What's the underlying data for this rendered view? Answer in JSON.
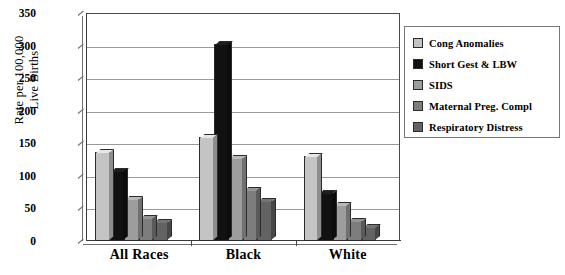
{
  "chart_data": {
    "type": "bar",
    "title": "",
    "xlabel": "",
    "ylabel": "Rate per 100,000 Live Births",
    "ylabel_lines": [
      "Rate per 100,000",
      "Live Births"
    ],
    "categories": [
      "All Races",
      "Black",
      "White"
    ],
    "ylim": [
      0,
      350
    ],
    "yticks": [
      0,
      50,
      100,
      150,
      200,
      250,
      300,
      350
    ],
    "ytick_labels": [
      "0",
      "50",
      "100",
      "150",
      "200",
      "250",
      "300",
      "350"
    ],
    "grid": true,
    "legend_position": "right",
    "series": [
      {
        "name": "Cong Anomalies",
        "color": "#c4c4c4",
        "values": [
          137,
          160,
          131
        ]
      },
      {
        "name": "Short Gest & LBW",
        "color": "#111111",
        "values": [
          108,
          303,
          74
        ]
      },
      {
        "name": "SIDS",
        "color": "#9d9d9d",
        "values": [
          65,
          128,
          55
        ]
      },
      {
        "name": "Maternal Preg. Compl",
        "color": "#7d7d7d",
        "values": [
          35,
          78,
          30
        ]
      },
      {
        "name": "Respiratory Distress",
        "color": "#636363",
        "values": [
          29,
          62,
          21
        ]
      }
    ]
  },
  "legend": {
    "items": [
      {
        "label": "Cong Anomalies",
        "color": "#c4c4c4"
      },
      {
        "label": "Short Gest & LBW",
        "color": "#111111"
      },
      {
        "label": "SIDS",
        "color": "#9d9d9d"
      },
      {
        "label": "Maternal Preg. Compl",
        "color": "#7d7d7d"
      },
      {
        "label": "Respiratory Distress",
        "color": "#636363"
      }
    ]
  },
  "axes": {
    "y_title_line1": "Rate per 100,000",
    "y_title_line2": "Live Births"
  }
}
